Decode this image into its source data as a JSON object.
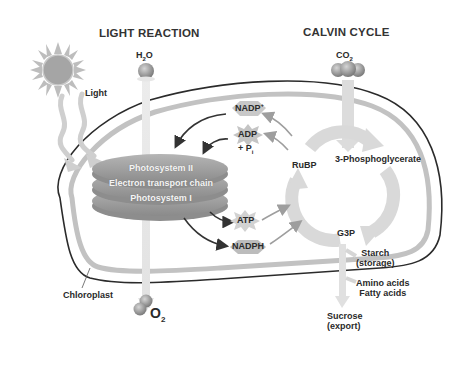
{
  "headings": {
    "light_reaction": "LIGHT REACTION",
    "calvin_cycle": "CALVIN CYCLE"
  },
  "inputs": {
    "water": {
      "base": "H",
      "sub": "2",
      "tail": "O"
    },
    "carbon_dioxide": {
      "base": "CO",
      "sub": "2"
    },
    "light": "Light"
  },
  "outputs": {
    "oxygen": {
      "base": "O",
      "sub": "2"
    },
    "sucrose": [
      "Sucrose",
      "(export)"
    ],
    "starch": [
      "Starch",
      "(storage)"
    ],
    "amino_fatty": [
      "Amino acids",
      "Fatty acids"
    ]
  },
  "thylakoid": {
    "lines": [
      "Photosystem II",
      "Electron transport chain",
      "Photosystem I"
    ]
  },
  "cofactors": {
    "nadp_plus": {
      "base": "NADP",
      "sup": "+"
    },
    "adp": "ADP",
    "pi": {
      "base": "+ P",
      "sub": "i"
    },
    "atp": "ATP",
    "nadph": "NADPH"
  },
  "calvin": {
    "rubp": "RuBP",
    "pga": "3-Phosphoglycerate",
    "g3p": "G3P"
  },
  "organelle": {
    "label": "Chloroplast"
  },
  "colors": {
    "outline": "#2b2b2b",
    "membrane": "#bdbdbd",
    "cycle_arrow": "#d9d9d9",
    "disc": "#9a9a9a",
    "arrow_dark": "#333333",
    "arrow_gray": "#9e9e9e",
    "sun": "#a8a8a8"
  }
}
